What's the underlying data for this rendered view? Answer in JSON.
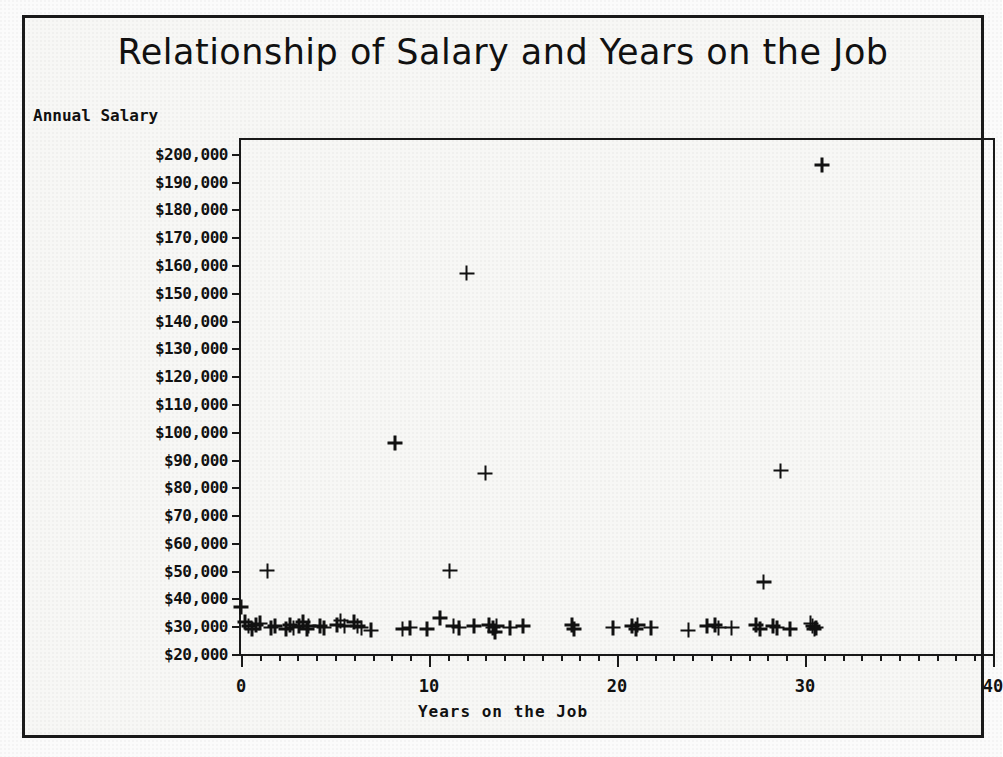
{
  "figure": {
    "title": "Relationship of Salary and Years on the Job",
    "y_axis_title": "Annual Salary",
    "x_axis_title": "Years on the Job"
  },
  "chart_data": {
    "type": "scatter",
    "title": "Relationship of Salary and Years on the Job",
    "xlabel": "Years on the Job",
    "ylabel": "Annual Salary",
    "xlim": [
      0,
      40
    ],
    "ylim": [
      20000,
      205000
    ],
    "grid": false,
    "legend": null,
    "marker": "plus",
    "marker_color": "#111111",
    "x_ticks": [
      0,
      10,
      20,
      30,
      40
    ],
    "x_tick_labels": [
      "0",
      "10",
      "20",
      "30",
      "40"
    ],
    "x_minor_tick_step": 1,
    "y_ticks": [
      20000,
      30000,
      40000,
      50000,
      60000,
      70000,
      80000,
      90000,
      100000,
      110000,
      120000,
      130000,
      140000,
      150000,
      160000,
      170000,
      180000,
      190000,
      200000
    ],
    "y_tick_labels": [
      "$20,000",
      "$30,000",
      "$40,000",
      "$50,000",
      "$60,000",
      "$70,000",
      "$80,000",
      "$90,000",
      "$100,000",
      "$110,000",
      "$120,000",
      "$130,000",
      "$140,000",
      "$150,000",
      "$160,000",
      "$170,000",
      "$180,000",
      "$190,000",
      "$200,000"
    ],
    "points": [
      [
        0.0,
        37000
      ],
      [
        0.2,
        31500
      ],
      [
        0.4,
        30000
      ],
      [
        0.6,
        29000
      ],
      [
        0.8,
        30500
      ],
      [
        1.0,
        31000
      ],
      [
        1.4,
        50000
      ],
      [
        1.6,
        29500
      ],
      [
        1.8,
        30000
      ],
      [
        2.4,
        29000
      ],
      [
        2.6,
        30500
      ],
      [
        2.8,
        29500
      ],
      [
        3.1,
        30000
      ],
      [
        3.3,
        31500
      ],
      [
        3.5,
        29000
      ],
      [
        3.6,
        30000
      ],
      [
        4.2,
        30000
      ],
      [
        4.4,
        29500
      ],
      [
        5.1,
        30500
      ],
      [
        5.3,
        32000
      ],
      [
        5.5,
        30000
      ],
      [
        6.0,
        31500
      ],
      [
        6.2,
        30000
      ],
      [
        6.4,
        29500
      ],
      [
        6.9,
        28500
      ],
      [
        8.2,
        96000
      ],
      [
        8.6,
        29000
      ],
      [
        9.0,
        29500
      ],
      [
        9.9,
        29000
      ],
      [
        10.6,
        33000
      ],
      [
        11.1,
        50000
      ],
      [
        11.3,
        30000
      ],
      [
        11.6,
        29500
      ],
      [
        12.0,
        157000
      ],
      [
        12.4,
        30000
      ],
      [
        13.0,
        85000
      ],
      [
        13.2,
        30500
      ],
      [
        13.4,
        29500
      ],
      [
        13.5,
        28000
      ],
      [
        13.6,
        30000
      ],
      [
        14.3,
        29500
      ],
      [
        15.0,
        30000
      ],
      [
        17.6,
        30500
      ],
      [
        17.7,
        29000
      ],
      [
        19.8,
        29500
      ],
      [
        20.8,
        30000
      ],
      [
        21.0,
        29000
      ],
      [
        21.1,
        30500
      ],
      [
        21.8,
        29500
      ],
      [
        23.8,
        28500
      ],
      [
        24.8,
        30000
      ],
      [
        25.2,
        30500
      ],
      [
        25.4,
        29500
      ],
      [
        26.1,
        29500
      ],
      [
        27.4,
        30500
      ],
      [
        27.6,
        29000
      ],
      [
        27.8,
        46000
      ],
      [
        28.3,
        30000
      ],
      [
        28.5,
        29500
      ],
      [
        28.7,
        86000
      ],
      [
        29.2,
        29000
      ],
      [
        30.3,
        31000
      ],
      [
        30.4,
        30000
      ],
      [
        30.5,
        29000
      ],
      [
        30.6,
        29500
      ],
      [
        30.9,
        196000
      ]
    ]
  }
}
